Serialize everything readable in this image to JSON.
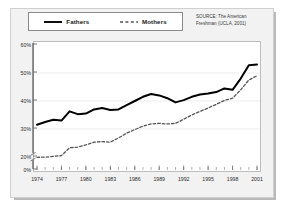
{
  "figure": {
    "background_color": "#f2f2f2",
    "plot_background_color": "#ffffff"
  },
  "legend": {
    "position": "top-left",
    "entries": [
      {
        "label": "Fathers",
        "style": "solid",
        "color": "#000000",
        "icon": "solid-line-swatch"
      },
      {
        "label": "Mothers",
        "style": "dashed",
        "color": "#555555",
        "icon": "dashed-line-swatch"
      }
    ]
  },
  "source_note": {
    "line1": "SOURCE: The American",
    "line2": "Freshman (UCLA, 2001)"
  },
  "chart_data": {
    "type": "line",
    "title": "",
    "subtitle": "",
    "xlabel": "",
    "ylabel": "",
    "xlim": [
      1974,
      2001
    ],
    "ylim": [
      0,
      60
    ],
    "grid": true,
    "axis_break": "y-axis breaks between 0% and 20%",
    "legend_position": "top-left",
    "ytick_labels": [
      "0%",
      "20%",
      "30%",
      "40%",
      "50%",
      "60%"
    ],
    "ytick_values": [
      0,
      20,
      30,
      40,
      50,
      60
    ],
    "xtick_labels": [
      "1974",
      "1977",
      "1980",
      "1983",
      "1986",
      "1989",
      "1992",
      "1995",
      "1998",
      "2001"
    ],
    "xtick_values": [
      1974,
      1977,
      1980,
      1983,
      1986,
      1989,
      1992,
      1995,
      1998,
      2001
    ],
    "x": [
      1974,
      1975,
      1976,
      1977,
      1978,
      1979,
      1980,
      1981,
      1982,
      1983,
      1984,
      1985,
      1986,
      1987,
      1988,
      1989,
      1990,
      1991,
      1992,
      1993,
      1994,
      1995,
      1996,
      1997,
      1998,
      1999,
      2000,
      2001
    ],
    "series": [
      {
        "name": "Fathers",
        "style": "solid",
        "color": "#000000",
        "values": [
          31.5,
          32.5,
          33.3,
          33.0,
          36.3,
          35.3,
          35.5,
          37.0,
          37.5,
          36.8,
          37.0,
          38.5,
          40.0,
          41.5,
          42.5,
          42.0,
          41.0,
          39.5,
          40.3,
          41.5,
          42.3,
          42.7,
          43.2,
          44.5,
          44.0,
          48.0,
          52.8,
          53.0
        ]
      },
      {
        "name": "Mothers",
        "style": "dashed",
        "color": "#555555",
        "values": [
          19.5,
          19.8,
          20.2,
          20.5,
          23.3,
          23.5,
          24.3,
          25.3,
          25.5,
          25.3,
          26.8,
          28.5,
          29.8,
          31.0,
          31.8,
          32.0,
          31.8,
          32.0,
          33.5,
          35.0,
          36.3,
          37.5,
          38.8,
          40.2,
          41.0,
          44.0,
          47.5,
          49.0
        ]
      }
    ]
  }
}
